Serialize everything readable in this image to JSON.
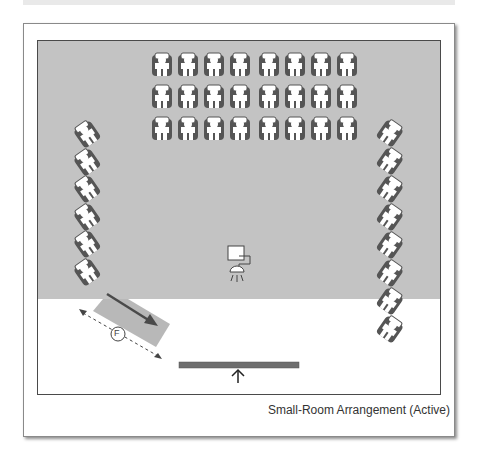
{
  "caption": "Small-Room Arrangement (Active)",
  "colors": {
    "seating_area": "#c3c3c3",
    "chair_dark": "#555555",
    "chair_light": "#ffffff",
    "screen_band": "#b8b8b8",
    "arrow": "#4a4a4a",
    "stage_bar": "#6e6e6e"
  },
  "seating": {
    "front_blocks": [
      {
        "name": "left-block",
        "columns": 4,
        "rows": 3
      },
      {
        "name": "right-block",
        "columns": 4,
        "rows": 3
      }
    ],
    "side_columns": [
      {
        "name": "left-side",
        "count": 6
      },
      {
        "name": "right-side",
        "count": 8
      }
    ]
  },
  "labels": {
    "screen_marker": "F"
  },
  "icons": {
    "projector": "projector-icon",
    "chair": "chair-icon",
    "stage_arrow": "arrow-up-icon"
  }
}
